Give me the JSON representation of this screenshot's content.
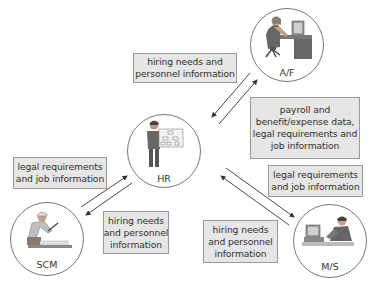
{
  "diagram": {
    "nodes": [
      {
        "id": "af",
        "label": "A/F",
        "figure": "person-at-computer-desk"
      },
      {
        "id": "hr",
        "label": "HR",
        "figure": "person-holding-org-chart"
      },
      {
        "id": "scm",
        "label": "SCM",
        "figure": "worker-sawing-board"
      },
      {
        "id": "ms",
        "label": "M/S",
        "figure": "person-on-phone-at-computer"
      }
    ],
    "boxes": {
      "hr_to_af": {
        "lines": [
          "hiring needs and",
          "personnel information"
        ]
      },
      "af_to_hr": {
        "lines": [
          "payroll and",
          "benefit/expense data,",
          "legal requirements and",
          "job information"
        ]
      },
      "hr_to_scm": {
        "lines": [
          "legal requirements",
          "and job information"
        ]
      },
      "scm_to_hr": {
        "lines": [
          "hiring needs",
          "and personnel",
          "information"
        ]
      },
      "hr_to_ms": {
        "lines": [
          "legal requirements",
          "and job information"
        ]
      },
      "ms_to_hr": {
        "lines": [
          "hiring needs",
          "and personnel",
          "information"
        ]
      }
    },
    "edges": [
      {
        "from": "af",
        "to": "hr",
        "label_ref": "hr_to_af"
      },
      {
        "from": "hr",
        "to": "af",
        "label_ref": "af_to_hr"
      },
      {
        "from": "scm",
        "to": "hr",
        "label_ref": "hr_to_scm"
      },
      {
        "from": "hr",
        "to": "scm",
        "label_ref": "scm_to_hr"
      },
      {
        "from": "hr",
        "to": "ms",
        "label_ref": "hr_to_ms"
      },
      {
        "from": "ms",
        "to": "hr",
        "label_ref": "ms_to_hr"
      }
    ],
    "colors": {
      "box_fill": "#e6e6e6",
      "box_border": "#9a9a9a",
      "line": "#333333",
      "circle_border": "#777777"
    }
  }
}
